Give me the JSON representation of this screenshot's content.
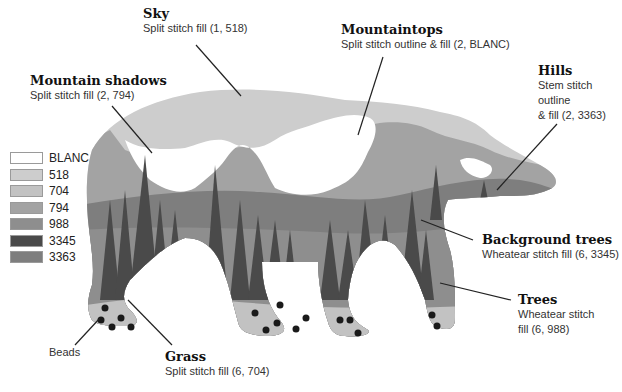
{
  "colors": {
    "BLANC": "#ffffff",
    "518": "#cdcdcd",
    "704": "#c2c2c2",
    "794": "#a3a3a3",
    "988": "#8e8e8e",
    "3345": "#4a4a4a",
    "3363": "#7e7e7e",
    "bead": "#1a1a1a",
    "leader": "#222222"
  },
  "legend": {
    "items": [
      {
        "label": "BLANC",
        "color": "#ffffff"
      },
      {
        "label": "518",
        "color": "#cdcdcd"
      },
      {
        "label": "704",
        "color": "#c2c2c2"
      },
      {
        "label": "794",
        "color": "#a3a3a3"
      },
      {
        "label": "988",
        "color": "#8e8e8e"
      },
      {
        "label": "3345",
        "color": "#4a4a4a"
      },
      {
        "label": "3363",
        "color": "#7e7e7e"
      }
    ]
  },
  "callouts": {
    "sky": {
      "title": "Sky",
      "desc": "Split stitch fill (1, 518)"
    },
    "mountain_shadows": {
      "title": "Mountain shadows",
      "desc": "Split stitch fill (2, 794)"
    },
    "mountaintops": {
      "title": "Mountaintops",
      "desc": "Split stitch outline & fill (2, BLANC)"
    },
    "hills": {
      "title": "Hills",
      "desc_line1": "Stem stitch outline",
      "desc_line2": "& fill (2, 3363)"
    },
    "background_trees": {
      "title": "Background trees",
      "desc": "Wheatear stitch fill (6, 3345)"
    },
    "trees": {
      "title": "Trees",
      "desc_line1": "Wheatear stitch",
      "desc_line2": "fill (6, 988)"
    },
    "grass": {
      "title": "Grass",
      "desc": "Split stitch fill (6, 704)"
    },
    "beads": {
      "label": "Beads"
    }
  }
}
